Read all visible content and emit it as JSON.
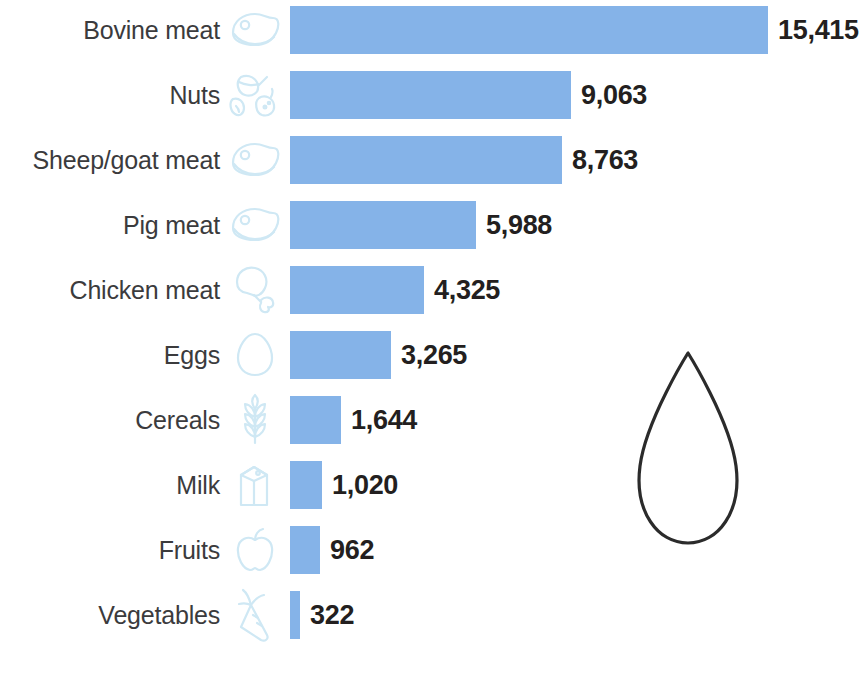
{
  "chart_data": {
    "type": "bar",
    "orientation": "horizontal",
    "title": "",
    "subtitle": "",
    "xlabel": "",
    "ylabel": "",
    "grid": false,
    "legend": false,
    "axis_visible": false,
    "value_labels_shown": true,
    "xlim": [
      0,
      15415
    ],
    "categories": [
      "Bovine meat",
      "Nuts",
      "Sheep/goat meat",
      "Pig meat",
      "Chicken meat",
      "Eggs",
      "Cereals",
      "Milk",
      "Fruits",
      "Vegetables"
    ],
    "values": [
      15415,
      9063,
      8763,
      5988,
      4325,
      3265,
      1644,
      1020,
      962,
      322
    ],
    "value_labels": [
      "15,415",
      "9,063",
      "8,763",
      "5,988",
      "4,325",
      "3,265",
      "1,644",
      "1,020",
      "962",
      "322"
    ],
    "bar_color": "#85b3e8",
    "label_color": "#3b3b3d",
    "value_color": "#231f20",
    "icon_color": "#cfe8f4"
  },
  "rows": [
    {
      "label": "Bovine meat",
      "value": 15415,
      "value_label": "15,415",
      "icon": "steak-icon"
    },
    {
      "label": "Nuts",
      "value": 9063,
      "value_label": "9,063",
      "icon": "nuts-icon"
    },
    {
      "label": "Sheep/goat meat",
      "value": 8763,
      "value_label": "8,763",
      "icon": "steak-icon"
    },
    {
      "label": "Pig meat",
      "value": 5988,
      "value_label": "5,988",
      "icon": "steak-icon"
    },
    {
      "label": "Chicken meat",
      "value": 4325,
      "value_label": "4,325",
      "icon": "drumstick-icon"
    },
    {
      "label": "Eggs",
      "value": 3265,
      "value_label": "3,265",
      "icon": "egg-icon"
    },
    {
      "label": "Cereals",
      "value": 1644,
      "value_label": "1,644",
      "icon": "wheat-icon"
    },
    {
      "label": "Milk",
      "value": 1020,
      "value_label": "1,020",
      "icon": "milk-carton-icon"
    },
    {
      "label": "Fruits",
      "value": 962,
      "value_label": "962",
      "icon": "apple-icon"
    },
    {
      "label": "Vegetables",
      "value": 322,
      "value_label": "322",
      "icon": "carrot-icon"
    }
  ],
  "decoration": {
    "droplet": "water-droplet-icon"
  }
}
